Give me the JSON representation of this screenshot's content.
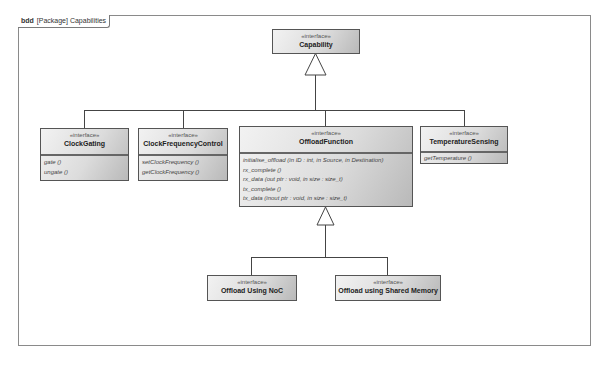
{
  "frame": {
    "kind": "bdd",
    "label": "[Package] Capabilities"
  },
  "stereotype": "«interface»",
  "blocks": {
    "capability": {
      "name": "Capability",
      "operations": []
    },
    "clock_gating": {
      "name": "ClockGating",
      "operations": [
        "gate ()",
        "ungate ()"
      ]
    },
    "clock_frequency_control": {
      "name": "ClockFrequencyControl",
      "operations": [
        "setClockFrequency ()",
        "getClockFrequency ()"
      ]
    },
    "offload_function": {
      "name": "OffloadFunction",
      "operations": [
        "initialise_offload (in ID : int, in Source, in Destination)",
        "rx_complete ()",
        "rx_data (out ptr : void, in size : size_t)",
        "tx_complete ()",
        "tx_data (inout ptr : void, in size : size_t)"
      ]
    },
    "temperature_sensing": {
      "name": "TemperatureSensing",
      "operations": [
        "getTemperature ()"
      ]
    },
    "offload_noc": {
      "name": "Offload Using NoC",
      "operations": []
    },
    "offload_shared_memory": {
      "name": "Offload using Shared Memory",
      "operations": []
    }
  },
  "relationships": [
    {
      "type": "generalization",
      "from": "ClockGating",
      "to": "Capability"
    },
    {
      "type": "generalization",
      "from": "ClockFrequencyControl",
      "to": "Capability"
    },
    {
      "type": "generalization",
      "from": "OffloadFunction",
      "to": "Capability"
    },
    {
      "type": "generalization",
      "from": "TemperatureSensing",
      "to": "Capability"
    },
    {
      "type": "generalization",
      "from": "Offload Using NoC",
      "to": "OffloadFunction"
    },
    {
      "type": "generalization",
      "from": "Offload using Shared Memory",
      "to": "OffloadFunction"
    }
  ]
}
